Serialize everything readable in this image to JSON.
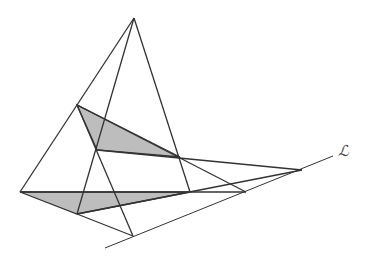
{
  "diagram": {
    "stroke_color": "#333333",
    "fill_color": "#bdbdbd",
    "points": {
      "O": [
        134,
        18
      ],
      "A1": [
        77,
        105
      ],
      "B1": [
        97,
        150
      ],
      "C1": [
        180,
        157
      ],
      "A2": [
        20,
        192
      ],
      "B2": [
        77,
        214
      ],
      "C2": [
        190,
        192
      ],
      "P": [
        133,
        236
      ],
      "Q": [
        246,
        192
      ],
      "R": [
        302,
        170
      ]
    },
    "triangles": [
      {
        "name": "upper-triangle",
        "vertices": [
          "A1",
          "B1",
          "C1"
        ],
        "shaded": true
      },
      {
        "name": "lower-triangle",
        "vertices": [
          "A2",
          "B2",
          "C2"
        ],
        "shaded": true
      }
    ],
    "segments": [
      [
        "O",
        "A2"
      ],
      [
        "O",
        "B2"
      ],
      [
        "O",
        "C2"
      ],
      [
        "A1",
        "P"
      ],
      [
        "B2",
        "P"
      ],
      [
        "A1",
        "Q"
      ],
      [
        "A2",
        "Q"
      ],
      [
        "B1",
        "R"
      ],
      [
        "B2",
        "R"
      ]
    ],
    "axis_line": {
      "from": [
        105,
        248
      ],
      "to": [
        333,
        156
      ],
      "label": "ℒ",
      "label_pos": [
        338,
        142
      ]
    }
  }
}
